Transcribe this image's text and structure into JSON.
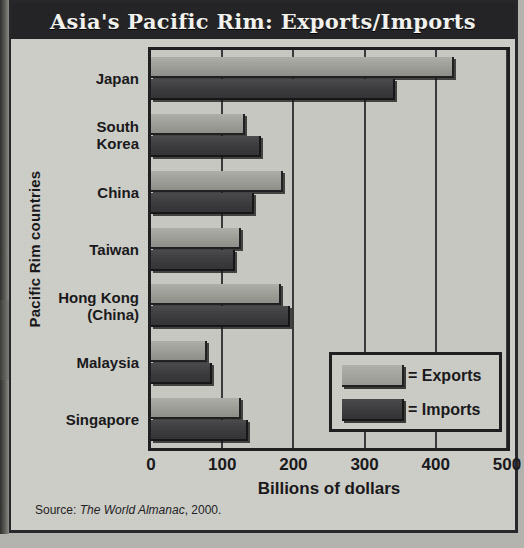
{
  "title": "Asia's Pacific Rim: Exports/Imports",
  "source": {
    "prefix": "Source: ",
    "work": "The World Almanac",
    "suffix": ", 2000."
  },
  "legend": {
    "exports_label": "= Exports",
    "imports_label": "= Imports"
  },
  "colors": {
    "title_band": "#232326",
    "title_text": "#f3f3ef",
    "paper": "#cfcfc9",
    "plot_bg": "#c9c9c3",
    "exports": "#9d9d97",
    "imports": "#3a3a3c",
    "frame": "#1e1e20"
  },
  "chart_data": {
    "type": "bar",
    "orientation": "horizontal",
    "title": "Asia's Pacific Rim: Exports/Imports",
    "xlabel": "Billions of dollars",
    "ylabel": "Pacific Rim countries",
    "xlim": [
      0,
      500
    ],
    "xticks": [
      0,
      100,
      200,
      300,
      400,
      500
    ],
    "xtick_labels": [
      "0",
      "100",
      "200",
      "300",
      "400",
      "500"
    ],
    "grid": true,
    "legend_position": "inside-lower-right",
    "categories": [
      "Japan",
      "South Korea",
      "China",
      "Taiwan",
      "Hong Kong (China)",
      "Malaysia",
      "Singapore"
    ],
    "category_lines": [
      [
        "Japan"
      ],
      [
        "South",
        "Korea"
      ],
      [
        "China"
      ],
      [
        "Taiwan"
      ],
      [
        "Hong Kong",
        "(China)"
      ],
      [
        "Malaysia"
      ],
      [
        "Singapore"
      ]
    ],
    "series": [
      {
        "name": "Exports",
        "values": [
          425,
          132,
          186,
          126,
          183,
          79,
          127
        ]
      },
      {
        "name": "Imports",
        "values": [
          343,
          155,
          144,
          118,
          195,
          86,
          136
        ]
      }
    ]
  }
}
